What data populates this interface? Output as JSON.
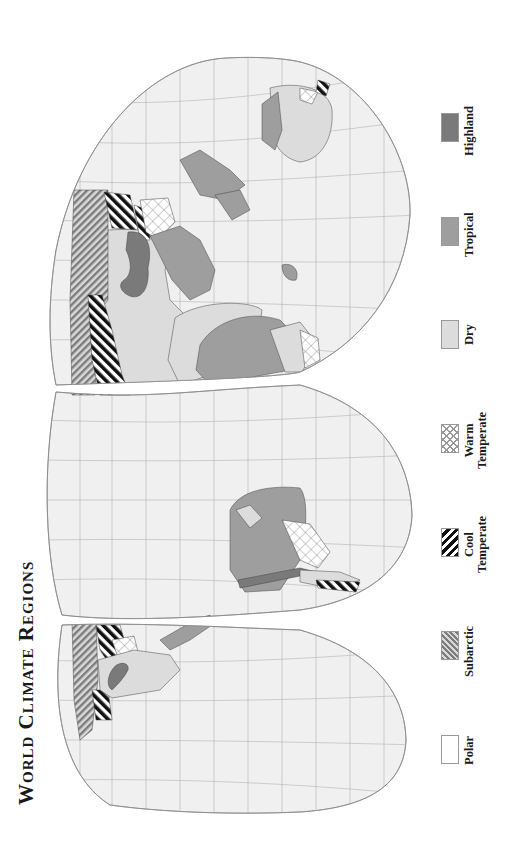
{
  "title": "World Climate Regions",
  "legend": {
    "items": [
      {
        "id": "polar",
        "label": "Polar",
        "lines": [
          "Polar"
        ],
        "fill": "#ffffff",
        "pattern": "none"
      },
      {
        "id": "subarctic",
        "label": "Subarctic",
        "lines": [
          "Subarctic"
        ],
        "fill": "#8c8c8c",
        "pattern": "fine-diagonal-stripes"
      },
      {
        "id": "cool-temperate",
        "label": "Cool Temperate",
        "lines": [
          "Cool",
          "Temperate"
        ],
        "fill": "#1a1a1a",
        "pattern": "bold-diagonal-stripes"
      },
      {
        "id": "warm-temperate",
        "label": "Warm Temperate",
        "lines": [
          "Warm",
          "Temperate"
        ],
        "fill": "#ffffff",
        "pattern": "crosshatch"
      },
      {
        "id": "dry",
        "label": "Dry",
        "lines": [
          "Dry"
        ],
        "fill": "#dcdcdc",
        "pattern": "solid"
      },
      {
        "id": "tropical",
        "label": "Tropical",
        "lines": [
          "Tropical"
        ],
        "fill": "#9e9e9e",
        "pattern": "solid"
      },
      {
        "id": "highland",
        "label": "Highland",
        "lines": [
          "Highland"
        ],
        "fill": "#7a7a7a",
        "pattern": "solid"
      }
    ]
  },
  "colors": {
    "ocean": "#f0f0f0",
    "graticule": "#b4b4b4",
    "outline": "#8a8a8a",
    "coast": "#444444",
    "text": "#1a1a1a"
  },
  "map": {
    "projection": "interrupted (Goode homolosine style), rotated 90°",
    "orientation": "north at left, south at right",
    "lobes": [
      "Eurasia / Africa / Australia",
      "South America / Atlantic",
      "North America / Pacific"
    ]
  }
}
